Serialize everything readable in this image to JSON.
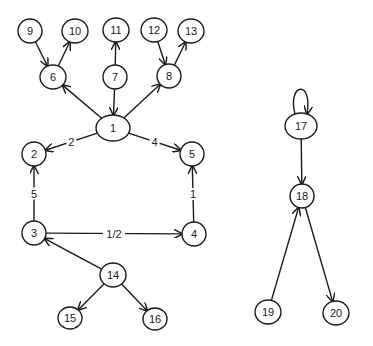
{
  "diagram": {
    "type": "directed-graph",
    "nodes": [
      {
        "id": "1",
        "label": "1",
        "x": 113,
        "y": 128,
        "rx": 17,
        "ry": 13
      },
      {
        "id": "2",
        "label": "2",
        "x": 34,
        "y": 154,
        "rx": 12,
        "ry": 12
      },
      {
        "id": "3",
        "label": "3",
        "x": 34,
        "y": 233,
        "rx": 12,
        "ry": 12
      },
      {
        "id": "4",
        "label": "4",
        "x": 194,
        "y": 234,
        "rx": 12,
        "ry": 12
      },
      {
        "id": "5",
        "label": "5",
        "x": 192,
        "y": 154,
        "rx": 12,
        "ry": 12
      },
      {
        "id": "6",
        "label": "6",
        "x": 53,
        "y": 77,
        "rx": 13,
        "ry": 12
      },
      {
        "id": "7",
        "label": "7",
        "x": 115,
        "y": 77,
        "rx": 12,
        "ry": 12
      },
      {
        "id": "8",
        "label": "8",
        "x": 169,
        "y": 76,
        "rx": 12,
        "ry": 12
      },
      {
        "id": "9",
        "label": "9",
        "x": 30,
        "y": 31,
        "rx": 12,
        "ry": 12
      },
      {
        "id": "10",
        "label": "10",
        "x": 75,
        "y": 31,
        "rx": 13,
        "ry": 12
      },
      {
        "id": "11",
        "label": "11",
        "x": 116,
        "y": 30,
        "rx": 13,
        "ry": 12
      },
      {
        "id": "12",
        "label": "12",
        "x": 154,
        "y": 30,
        "rx": 13,
        "ry": 12
      },
      {
        "id": "13",
        "label": "13",
        "x": 191,
        "y": 31,
        "rx": 13,
        "ry": 12
      },
      {
        "id": "14",
        "label": "14",
        "x": 113,
        "y": 275,
        "rx": 13,
        "ry": 12
      },
      {
        "id": "15",
        "label": "15",
        "x": 70,
        "y": 318,
        "rx": 12,
        "ry": 11
      },
      {
        "id": "16",
        "label": "16",
        "x": 155,
        "y": 319,
        "rx": 12,
        "ry": 11
      },
      {
        "id": "17",
        "label": "17",
        "x": 301,
        "y": 126,
        "rx": 16,
        "ry": 13
      },
      {
        "id": "18",
        "label": "18",
        "x": 302,
        "y": 196,
        "rx": 12,
        "ry": 12
      },
      {
        "id": "19",
        "label": "19",
        "x": 268,
        "y": 312,
        "rx": 13,
        "ry": 12
      },
      {
        "id": "20",
        "label": "20",
        "x": 336,
        "y": 313,
        "rx": 13,
        "ry": 12
      }
    ],
    "edges": [
      {
        "from": "9",
        "to": "6",
        "label": ""
      },
      {
        "from": "6",
        "to": "10",
        "label": ""
      },
      {
        "from": "7",
        "to": "11",
        "label": ""
      },
      {
        "from": "12",
        "to": "8",
        "label": ""
      },
      {
        "from": "8",
        "to": "13",
        "label": ""
      },
      {
        "from": "7",
        "to": "1",
        "label": ""
      },
      {
        "from": "1",
        "to": "6",
        "label": ""
      },
      {
        "from": "1",
        "to": "8",
        "label": ""
      },
      {
        "from": "1",
        "to": "2",
        "label": "2"
      },
      {
        "from": "1",
        "to": "5",
        "label": "4"
      },
      {
        "from": "3",
        "to": "2",
        "label": "5"
      },
      {
        "from": "4",
        "to": "5",
        "label": "1"
      },
      {
        "from": "3",
        "to": "4",
        "label": "1/2"
      },
      {
        "from": "14",
        "to": "3",
        "label": ""
      },
      {
        "from": "14",
        "to": "15",
        "label": ""
      },
      {
        "from": "14",
        "to": "16",
        "label": ""
      },
      {
        "from": "17",
        "to": "17",
        "label": "",
        "self_loop": true
      },
      {
        "from": "17",
        "to": "18",
        "label": ""
      },
      {
        "from": "19",
        "to": "18",
        "label": ""
      },
      {
        "from": "18",
        "to": "20",
        "label": ""
      }
    ]
  }
}
